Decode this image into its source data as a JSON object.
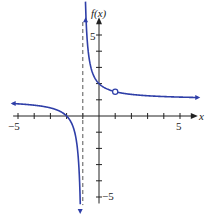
{
  "chart_data": {
    "type": "line",
    "title": "",
    "xlabel": "x",
    "ylabel": "f(x)",
    "xlim": [
      -5.2,
      6
    ],
    "ylim": [
      -5.5,
      6
    ],
    "x_ticks": [
      -5,
      -4,
      -3,
      -2,
      -1,
      0,
      1,
      2,
      3,
      4,
      5
    ],
    "y_ticks": [
      -5,
      -4,
      -3,
      -2,
      -1,
      1,
      2,
      3,
      4,
      5
    ],
    "x_tick_labels": {
      "-5": "−5",
      "5": "5"
    },
    "y_tick_labels": {
      "-5": "−5",
      "5": "5"
    },
    "grid": false,
    "function": "f(x) = (x+2)/(x+1), x ≠ 1",
    "vertical_asymptote": -1,
    "horizontal_asymptote": 1,
    "open_point": {
      "x": 1,
      "y": 1.5
    },
    "x_intercept": -2,
    "y_intercept": 2,
    "series": [
      {
        "name": "left branch",
        "x": [
          -5.2,
          -4,
          -3,
          -2,
          -1.5,
          -1.2,
          -1.14
        ],
        "y": [
          0.76,
          0.67,
          0.5,
          0,
          -1,
          -4,
          -6
        ]
      },
      {
        "name": "right branch",
        "x": [
          -0.86,
          -0.8,
          -0.5,
          0,
          1,
          2,
          3,
          4,
          5,
          6
        ],
        "y": [
          8,
          6,
          3,
          2,
          1.5,
          1.33,
          1.25,
          1.2,
          1.17,
          1.14
        ]
      }
    ],
    "colors": {
      "curve": "#2f3fa8",
      "axis": "#222222",
      "asymptote": "#555555"
    }
  },
  "labels": {
    "x_axis": "x",
    "y_axis": "f(x)",
    "x_min": "−5",
    "x_max": "5",
    "y_max": "5",
    "y_min": "−5"
  }
}
